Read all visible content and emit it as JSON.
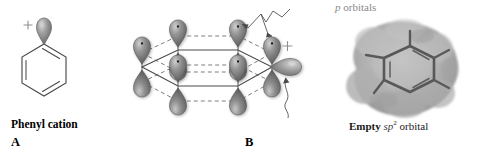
{
  "figure": {
    "background_color": "#ffffff",
    "panels": [
      {
        "letter": "A",
        "name": "Phenyl cation",
        "type": "skeletal-structure",
        "description": "Benzene ring bearing a single lobe orbital at the top carbon with a plus charge",
        "charge_symbol": "+"
      },
      {
        "letter": "B",
        "name": "",
        "type": "orbital-diagram",
        "description": "Hexagonal sigma framework with p orbitals above and below each ring carbon and one empty sp2 orbital in the ring plane",
        "charge_symbol": "+"
      },
      {
        "letter": "C",
        "name": "",
        "type": "electrostatic-potential-map",
        "description": "Electrostatic potential surface of the phenyl cation with the benzene skeleton visible inside"
      }
    ],
    "annotations": {
      "p_orbitals": {
        "italic_part": "p",
        "plain_part": " orbitals",
        "color": "#8a8a8a"
      },
      "empty_sp2_orbital": {
        "bold_part": "Empty",
        "italic_part": "sp",
        "superscript": "2",
        "tail_part": " orbital",
        "color": "#1a1a1a"
      }
    },
    "colors": {
      "orbital_fill_dark": "#7c7c7c",
      "orbital_fill_light": "#c9c9c9",
      "orbital_outline": "#5e5e5e",
      "bond_line": "#4a4a4a",
      "dashed_line": "#6f6f6f",
      "charge_text": "#8f8f8f",
      "potential_map_outer": "#b9b9b9",
      "potential_map_inner": "#9a9a9a"
    }
  }
}
